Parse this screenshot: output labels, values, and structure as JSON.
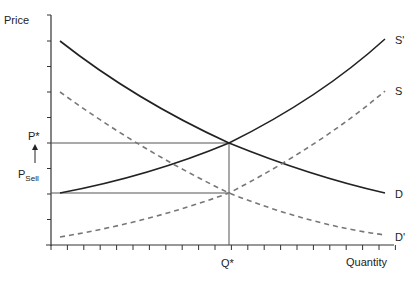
{
  "chart_data": {
    "type": "line",
    "title": "",
    "xlabel": "Quantity",
    "ylabel": "Price",
    "grid": false,
    "x_ticks": 21,
    "y_ticks": 9,
    "annotations": {
      "p_star": "P*",
      "p_sell_main": "P",
      "p_sell_sub": "Sell",
      "q_star": "Q*",
      "arrow": "up-arrow from P_Sell to P*"
    },
    "reference_lines": [
      {
        "name": "P*",
        "type": "horizontal",
        "y_level": 4,
        "to_x": "Q*"
      },
      {
        "name": "P_Sell",
        "type": "horizontal",
        "y_level": 2,
        "to_x": "Q*"
      },
      {
        "name": "Q*",
        "type": "vertical",
        "x_level": 10.5
      }
    ],
    "series": [
      {
        "name": "D",
        "style": "solid",
        "points": [
          [
            0.5,
            8
          ],
          [
            10.5,
            4
          ],
          [
            20,
            2
          ]
        ]
      },
      {
        "name": "S'",
        "style": "solid",
        "points": [
          [
            0.5,
            2
          ],
          [
            10.5,
            4
          ],
          [
            20,
            8.1
          ]
        ]
      },
      {
        "name": "D'",
        "style": "dashed",
        "points": [
          [
            0.5,
            6
          ],
          [
            10.5,
            2
          ],
          [
            20,
            0.4
          ]
        ]
      },
      {
        "name": "S",
        "style": "dashed",
        "points": [
          [
            0.5,
            0.3
          ],
          [
            10.5,
            2
          ],
          [
            20,
            6.1
          ]
        ]
      }
    ],
    "xlim": [
      0,
      21
    ],
    "ylim": [
      0,
      9
    ]
  },
  "labels": {
    "y_axis": "Price",
    "x_axis": "Quantity",
    "p_star": "P*",
    "p_sell": "P",
    "p_sell_sub": "Sell",
    "q_star": "Q*",
    "curve_s_prime": "S'",
    "curve_s": "S",
    "curve_d": "D",
    "curve_d_prime": "D'"
  }
}
